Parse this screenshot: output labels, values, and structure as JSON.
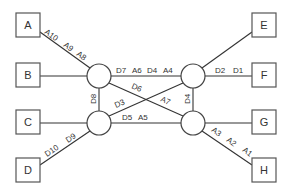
{
  "diagram": {
    "boxes": [
      {
        "id": "A",
        "label": "A",
        "x": 16,
        "y": 13
      },
      {
        "id": "B",
        "label": "B",
        "x": 16,
        "y": 63
      },
      {
        "id": "C",
        "label": "C",
        "x": 16,
        "y": 110
      },
      {
        "id": "D",
        "label": "D",
        "x": 16,
        "y": 158
      },
      {
        "id": "E",
        "label": "E",
        "x": 252,
        "y": 13
      },
      {
        "id": "F",
        "label": "F",
        "x": 252,
        "y": 63
      },
      {
        "id": "G",
        "label": "G",
        "x": 252,
        "y": 110
      },
      {
        "id": "H",
        "label": "H",
        "x": 252,
        "y": 158
      }
    ],
    "nodes": [
      {
        "id": "n1",
        "cx": 99,
        "cy": 76
      },
      {
        "id": "n2",
        "cx": 193,
        "cy": 76
      },
      {
        "id": "n3",
        "cx": 99,
        "cy": 123
      },
      {
        "id": "n4",
        "cx": 193,
        "cy": 123
      }
    ],
    "edge_labels": {
      "a_to_n1": [
        "A10",
        "A9",
        "A8"
      ],
      "n1_to_n2": [
        "D7",
        "A6",
        "D4",
        "A4"
      ],
      "n2_to_f": [
        "D2",
        "D1"
      ],
      "n1_to_n4": [
        "D6",
        "A7"
      ],
      "n3_to_n2": [
        "D3"
      ],
      "n1_to_n3": [
        "D8"
      ],
      "n2_to_n4": [
        "D4"
      ],
      "n3_to_n4": [
        "D5",
        "A5"
      ],
      "d_to_n3": [
        "D10",
        "D9"
      ],
      "n4_to_h": [
        "A3",
        "A2",
        "A1"
      ]
    },
    "text": {
      "A10": "A10",
      "A9": "A9",
      "A8": "A8",
      "D7": "D7",
      "A6": "A6",
      "D4a": "D4",
      "A4": "A4",
      "D2": "D2",
      "D1": "D1",
      "D6": "D6",
      "A7": "A7",
      "D3": "D3",
      "D8": "D8",
      "D4b": "D4",
      "D5": "D5",
      "A5": "A5",
      "D10": "D10",
      "D9": "D9",
      "A3": "A3",
      "A2": "A2",
      "A1": "A1"
    }
  }
}
